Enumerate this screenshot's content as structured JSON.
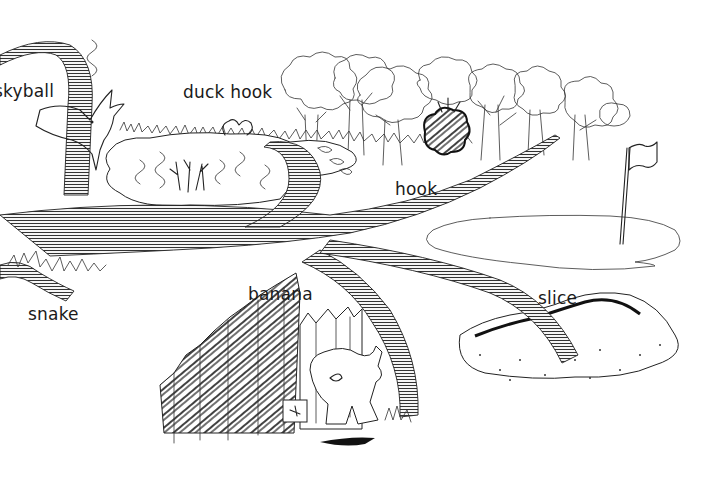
{
  "illustration": {
    "subject": "golf shot types",
    "labels": {
      "skyball": "skyball",
      "duck_hook": "duck hook",
      "hook": "hook",
      "banana": "banana",
      "slice": "slice",
      "snake": "snake"
    },
    "elements": [
      "skyball-trajectory",
      "bird",
      "pond-hazard",
      "tree-line",
      "dark-bush",
      "putting-green",
      "flagstick",
      "sand-bunker",
      "wooden-fence",
      "golfer",
      "rough-grass"
    ],
    "colors": {
      "ink": "#222222",
      "background": "#ffffff",
      "bush": "#111111"
    }
  }
}
